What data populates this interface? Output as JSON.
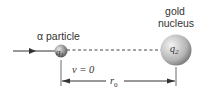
{
  "diagram": {
    "alpha_label": "α particle",
    "nucleus_label_line1": "gold",
    "nucleus_label_line2": "nucleus",
    "charge1": "q",
    "charge1_sub": "1",
    "charge2": "q",
    "charge2_sub": "2",
    "velocity_label": "v = 0",
    "distance_label": "r",
    "distance_sub": "0"
  },
  "colors": {
    "line": "#333333",
    "sphere_small_light": "#e0e0e0",
    "sphere_small_dark": "#6a6a6a",
    "sphere_large_light": "#f2f2f2",
    "sphere_large_dark": "#8a8a8a"
  }
}
